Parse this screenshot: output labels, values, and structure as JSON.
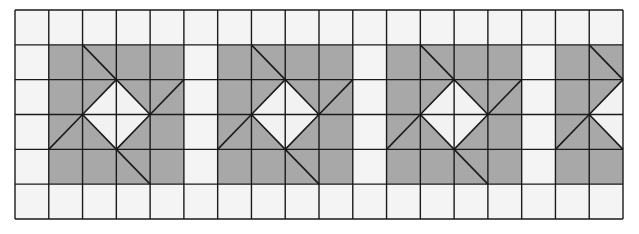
{
  "diagram": {
    "grid": {
      "cols": 18,
      "rows": 6,
      "left": 15,
      "top": 10,
      "width": 608,
      "height": 209
    },
    "colors": {
      "background": "#ffffff",
      "cell": "#f4f4f4",
      "shade": "#a8a8a8",
      "diamond": "#f2f2f2",
      "line": "#1a1a1a"
    },
    "motifs": [
      {
        "col_start": 1,
        "diamond_center_x": 3
      },
      {
        "col_start": 6,
        "diamond_center_x": 8
      },
      {
        "col_start": 11,
        "diamond_center_x": 13
      },
      {
        "col_start": 16,
        "diamond_center_x": 18
      }
    ],
    "motif_rows": [
      1,
      4
    ],
    "motif_width": 4
  }
}
